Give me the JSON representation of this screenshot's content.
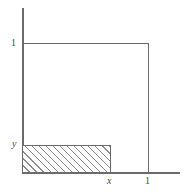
{
  "figure": {
    "title": "",
    "background_color": "#ffffff",
    "line_color": "#6b6b6b",
    "hatch_color": "#8a8a8a",
    "label_color": "#4a4a4a"
  },
  "labels": {
    "y_axis_one": "1",
    "y_axis_y": "y",
    "x_axis_x": "x",
    "x_axis_one": "1"
  },
  "chart_data": {
    "type": "area",
    "title": "",
    "xlabel": "",
    "ylabel": "",
    "xlim": [
      0,
      1.25
    ],
    "ylim": [
      0,
      1.25
    ],
    "grid": false,
    "legend": null,
    "xticks": [
      {
        "value": 0.72,
        "label": "x"
      },
      {
        "value": 1.0,
        "label": "1"
      }
    ],
    "yticks": [
      {
        "value": 0.215,
        "label": "y"
      },
      {
        "value": 1.0,
        "label": "1"
      }
    ],
    "shapes": [
      {
        "name": "unit-square",
        "kind": "rectangle",
        "x0": 0,
        "y0": 0,
        "x1": 1.0,
        "y1": 1.0,
        "fill": "none",
        "stroke": "#6b6b6b",
        "note": "outline of unit square drawn on top and right edges"
      },
      {
        "name": "hatched-region",
        "kind": "rectangle",
        "x0": 0,
        "y0": 0,
        "x1": 0.72,
        "y1": 0.215,
        "fill": "hatch-45deg",
        "stroke": "#6b6b6b",
        "note": "region [0,x] x [0,y] shaded with 45 degree hatch lines"
      }
    ],
    "annotations": [
      {
        "text": "1",
        "x": -0.07,
        "y": 1.0,
        "italic": false
      },
      {
        "text": "y",
        "x": -0.07,
        "y": 0.215,
        "italic": true
      },
      {
        "text": "x",
        "x": 0.72,
        "y": -0.06,
        "italic": true
      },
      {
        "text": "1",
        "x": 1.0,
        "y": -0.06,
        "italic": false
      }
    ]
  }
}
